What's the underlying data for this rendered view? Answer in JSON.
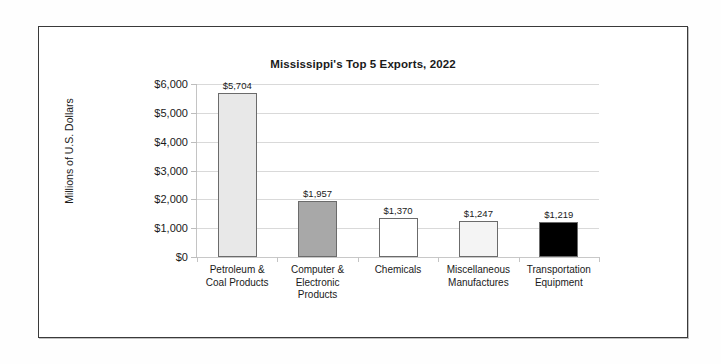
{
  "chart_data": {
    "type": "bar",
    "title": "Mississippi's Top 5 Exports, 2022",
    "xlabel": "",
    "ylabel": "Millions of U.S. Dollars",
    "ylim": [
      0,
      6000
    ],
    "ytick_step": 1000,
    "grid": true,
    "legend": "none",
    "categories": [
      "Petroleum &\nCoal Products",
      "Computer &\nElectronic\nProducts",
      "Chemicals",
      "Miscellaneous\nManufactures",
      "Transportation\nEquipment"
    ],
    "values": [
      5704,
      1957,
      1370,
      1247,
      1219
    ],
    "value_labels": [
      "$5,704",
      "$1,957",
      "$1,370",
      "$1,247",
      "$1,219"
    ],
    "ytick_labels": [
      "$6,000",
      "$5,000",
      "$4,000",
      "$3,000",
      "$2,000",
      "$1,000",
      "$0"
    ],
    "ytick_values": [
      6000,
      5000,
      4000,
      3000,
      2000,
      1000,
      0
    ],
    "bar_colors": [
      "#e8e8e8",
      "#a8a8a8",
      "#ffffff",
      "#f4f4f4",
      "#000000"
    ],
    "bar_border_color": "#6b6b6b",
    "gridline_color": "#d9d9d9",
    "frame_color": "#3a3a3a",
    "text_color": "#1a1a1a"
  },
  "categories": [
    {
      "line1": "Petroleum &",
      "line2": "Coal Products",
      "line3": ""
    },
    {
      "line1": "Computer &",
      "line2": "Electronic",
      "line3": "Products"
    },
    {
      "line1": "Chemicals",
      "line2": "",
      "line3": ""
    },
    {
      "line1": "Miscellaneous",
      "line2": "Manufactures",
      "line3": ""
    },
    {
      "line1": "Transportation",
      "line2": "Equipment",
      "line3": ""
    }
  ]
}
